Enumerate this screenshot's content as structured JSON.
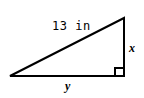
{
  "figure": {
    "kind": "right-triangle-diagram",
    "background_color": "#ffffff",
    "stroke_color": "#000000",
    "stroke_width": 2,
    "vertices": {
      "left": {
        "x": 10,
        "y": 76
      },
      "top_right": {
        "x": 124,
        "y": 18
      },
      "bottom_right": {
        "x": 124,
        "y": 76
      }
    },
    "right_angle_marker": {
      "corner": "bottom-right",
      "size": 8
    },
    "labels": {
      "hypotenuse": "13 in",
      "vertical_leg": "x",
      "horizontal_leg": "y"
    }
  }
}
